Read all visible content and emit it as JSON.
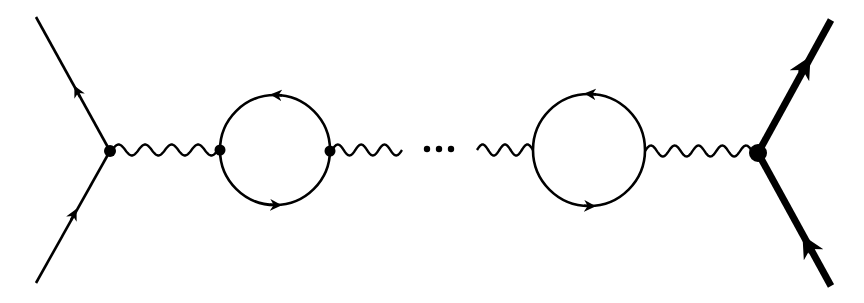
{
  "diagram": {
    "type": "feynman-diagram",
    "colors": {
      "line": "#000000",
      "background": "#ffffff"
    },
    "elements": {
      "left_vertex": "light-fermion-vertex",
      "loops": [
        "fermion-loop-1",
        "fermion-loop-2"
      ],
      "ellipsis": "…",
      "right_vertex": "heavy-fermion-vertex"
    }
  }
}
